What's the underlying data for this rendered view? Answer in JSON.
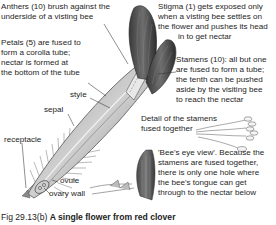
{
  "figure": {
    "number": "Fig 29.13(b)",
    "title": "A single flower from red clover"
  },
  "labels": {
    "anthers": [
      "Anthers (10) brush against the",
      "underside of a visting bee"
    ],
    "petals": [
      "Petals (5) are fused to",
      "form a corolla tube;",
      "nectar is formed at",
      "the bottom of the tube"
    ],
    "style": "style",
    "sepal": "sepal",
    "receptacle": "receptacle",
    "ovule": "ovule",
    "ovary_wall": "ovary wall",
    "stigma": [
      "Stigma (1) gets exposed only",
      "when a visting bee settles on",
      "the flower and pushes its head",
      "in to get nectar"
    ],
    "stamens": [
      "Stamens (10): all but one",
      "are fused to form a tube;",
      "the tenth can be pushed",
      "aside by the visiting bee",
      "to reach the nectar"
    ],
    "detail_stamens": [
      "Detail of the stamens",
      "fused together"
    ],
    "bees_eye": [
      "'Bee's eye view'. Because the",
      "stamens are fused together,",
      "there is only one hole where",
      "the bee's tongue can get",
      "through to the nectar below"
    ]
  },
  "colors": {
    "flower_dark": "#4a4a4a",
    "flower_mid": "#8a8a8a",
    "flower_light": "#d6d6d6",
    "leader_line": "#333333"
  }
}
